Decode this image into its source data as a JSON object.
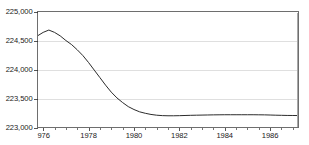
{
  "chart_data": {
    "type": "line",
    "title": "",
    "subtitle": "",
    "xlabel": "",
    "ylabel": "",
    "xlim": [
      1975.75,
      1987.25
    ],
    "ylim": [
      223000,
      225000
    ],
    "grid": true,
    "legend": null,
    "y_ticks": [
      223000,
      223500,
      224000,
      224500,
      225000
    ],
    "y_tick_labels": [
      "223,000",
      "223,500",
      "224,000",
      "224,500",
      "225,000"
    ],
    "x_ticks": [
      1976,
      1978,
      1980,
      1982,
      1984,
      1986
    ],
    "x_tick_labels": [
      "976",
      "1978",
      "1980",
      "1982",
      "1984",
      "1986"
    ],
    "x_minor_tick_interval": 0.5,
    "line_color": "#2b2b2b",
    "grid_color": "#c9c9c9",
    "frame_color": "#6e6e6e",
    "series": [
      {
        "name": "series-1",
        "x": [
          1975.75,
          1976.0,
          1976.25,
          1976.5,
          1976.75,
          1977.0,
          1977.25,
          1977.5,
          1977.75,
          1978.0,
          1978.25,
          1978.5,
          1978.75,
          1979.0,
          1979.25,
          1979.5,
          1979.75,
          1980.0,
          1980.25,
          1980.5,
          1980.75,
          1981.0,
          1981.25,
          1981.5,
          1981.75,
          1982.0,
          1982.25,
          1982.5,
          1982.75,
          1983.0,
          1983.25,
          1983.5,
          1983.75,
          1984.0,
          1984.25,
          1984.5,
          1984.75,
          1985.0,
          1985.25,
          1985.5,
          1985.75,
          1986.0,
          1986.25,
          1986.5,
          1986.75,
          1987.0,
          1987.25
        ],
        "y": [
          224580,
          224640,
          224680,
          224640,
          224580,
          224500,
          224430,
          224340,
          224240,
          224120,
          223990,
          223860,
          223730,
          223610,
          223510,
          223430,
          223360,
          223310,
          223270,
          223245,
          223225,
          223212,
          223205,
          223202,
          223202,
          223204,
          223207,
          223210,
          223212,
          223214,
          223216,
          223218,
          223219,
          223220,
          223220,
          223220,
          223220,
          223220,
          223220,
          223219,
          223218,
          223215,
          223212,
          223210,
          223208,
          223207,
          223206
        ]
      }
    ]
  },
  "axes": {
    "y_axis_name": "y-axis",
    "x_axis_name": "x-axis"
  }
}
